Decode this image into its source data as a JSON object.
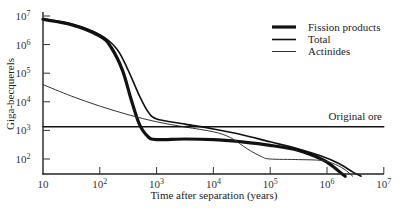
{
  "chart_data": {
    "type": "line",
    "title": "",
    "xlabel": "Time after separation (years)",
    "ylabel": "Giga-becquerels",
    "xscale": "log",
    "yscale": "log",
    "xlim": [
      10,
      10000000
    ],
    "ylim": [
      25,
      10000000
    ],
    "x_ticks": [
      "10",
      "10^2",
      "10^3",
      "10^4",
      "10^5",
      "10^6",
      "10^7"
    ],
    "y_ticks": [
      "10^2",
      "10^3",
      "10^4",
      "10^5",
      "10^6",
      "10^7"
    ],
    "grid": false,
    "legend_position": "upper right",
    "series": [
      {
        "name": "Fission products",
        "style": "thick",
        "stroke_width": 3.2,
        "points_log10": [
          [
            1.0,
            6.88
          ],
          [
            1.5,
            6.7
          ],
          [
            2.0,
            6.3
          ],
          [
            2.2,
            5.9
          ],
          [
            2.4,
            5.1
          ],
          [
            2.55,
            4.1
          ],
          [
            2.7,
            3.2
          ],
          [
            2.85,
            2.78
          ],
          [
            3.0,
            2.68
          ],
          [
            3.5,
            2.7
          ],
          [
            4.0,
            2.68
          ],
          [
            4.5,
            2.6
          ],
          [
            5.0,
            2.48
          ],
          [
            5.5,
            2.3
          ],
          [
            5.9,
            2.0
          ],
          [
            6.1,
            1.75
          ],
          [
            6.25,
            1.5
          ],
          [
            6.32,
            1.4
          ]
        ]
      },
      {
        "name": "Total",
        "style": "medium",
        "stroke_width": 1.6,
        "points_log10": [
          [
            1.0,
            6.9
          ],
          [
            1.5,
            6.72
          ],
          [
            2.0,
            6.35
          ],
          [
            2.3,
            5.85
          ],
          [
            2.5,
            5.1
          ],
          [
            2.7,
            4.2
          ],
          [
            2.85,
            3.65
          ],
          [
            3.0,
            3.4
          ],
          [
            3.5,
            3.22
          ],
          [
            4.0,
            3.05
          ],
          [
            4.5,
            2.85
          ],
          [
            5.0,
            2.6
          ],
          [
            5.5,
            2.35
          ],
          [
            5.9,
            2.1
          ],
          [
            6.2,
            1.85
          ],
          [
            6.45,
            1.55
          ],
          [
            6.6,
            1.4
          ]
        ]
      },
      {
        "name": "Actinides",
        "style": "thin",
        "stroke_width": 1.0,
        "points_log10": [
          [
            1.0,
            4.6
          ],
          [
            1.5,
            4.2
          ],
          [
            2.0,
            3.85
          ],
          [
            2.5,
            3.55
          ],
          [
            3.0,
            3.3
          ],
          [
            3.5,
            3.12
          ],
          [
            4.0,
            2.95
          ],
          [
            4.3,
            2.75
          ],
          [
            4.6,
            2.35
          ],
          [
            4.85,
            2.08
          ],
          [
            5.0,
            2.0
          ],
          [
            5.5,
            1.98
          ],
          [
            5.9,
            1.95
          ],
          [
            6.1,
            1.85
          ],
          [
            6.3,
            1.65
          ],
          [
            6.45,
            1.4
          ]
        ]
      },
      {
        "name": "Original ore",
        "style": "reference-line",
        "stroke_width": 1.4,
        "points_log10": [
          [
            1.0,
            3.13
          ],
          [
            7.0,
            3.13
          ]
        ]
      }
    ],
    "annotations": [
      {
        "text": "Original ore",
        "near": "horizontal line at ~1.3×10^3 GBq, right side"
      }
    ]
  },
  "axes": {
    "x_title": "Time after separation (years)",
    "y_title": "Giga-becquerels",
    "x_tick_labels": [
      {
        "base": "10",
        "exp": ""
      },
      {
        "base": "10",
        "exp": "2"
      },
      {
        "base": "10",
        "exp": "3"
      },
      {
        "base": "10",
        "exp": "4"
      },
      {
        "base": "10",
        "exp": "5"
      },
      {
        "base": "10",
        "exp": "6"
      },
      {
        "base": "10",
        "exp": "7"
      }
    ],
    "y_tick_labels": [
      {
        "base": "10",
        "exp": "7"
      },
      {
        "base": "10",
        "exp": "6"
      },
      {
        "base": "10",
        "exp": "5"
      },
      {
        "base": "10",
        "exp": "4"
      },
      {
        "base": "10",
        "exp": "3"
      },
      {
        "base": "10",
        "exp": "2"
      }
    ]
  },
  "legend": {
    "items": [
      {
        "label": "Fission products",
        "stroke_width": 3.2
      },
      {
        "label": "Total",
        "stroke_width": 1.6
      },
      {
        "label": "Actinides",
        "stroke_width": 1.0
      }
    ]
  },
  "annotation_label": "Original ore",
  "colors": {
    "line": "#111111",
    "axis": "#222222",
    "background": "#ffffff"
  }
}
